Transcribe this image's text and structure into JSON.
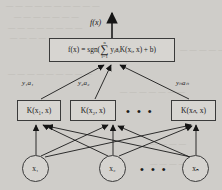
{
  "figure": {
    "type": "svm-architecture-diagram",
    "output_label": "f(x)",
    "decision_function": {
      "lhs": "f(x)",
      "equals": "=",
      "operator": "sgn(",
      "sum_upper": "n",
      "sum_lower": "i=1",
      "sum_symbol": "∑",
      "term": "yᵢaᵢK(xᵢ, x)",
      "plus_bias": "+ b)",
      "full_text": "f(x) = sgn( ∑(i=1..n) yᵢaᵢK(xᵢ, x) + b )"
    },
    "weights": [
      {
        "label": "y₁a₁"
      },
      {
        "label": "y₂a₂"
      },
      {
        "label": "yₙaₙ"
      }
    ],
    "kernel_nodes": [
      {
        "label": "K(x₁, x)"
      },
      {
        "label": "K(x₂, x)"
      },
      {
        "label": "K(xₙ, x)"
      }
    ],
    "kernel_row_ellipsis": "• • •",
    "input_nodes": [
      {
        "label": "x₁"
      },
      {
        "label": "x₂"
      },
      {
        "label": "xₙ"
      }
    ],
    "input_row_ellipsis": "• • •",
    "colors": {
      "page_background": "#cfcdc9",
      "node_fill": "#d7d5d1",
      "stroke": "#3a3a3a",
      "text": "#1a1a1a",
      "ghost_text": "#b9b6b1"
    }
  },
  "background_text": {
    "lines": [
      "— — — — — — — — — —",
      "— — — — — — —",
      "— — — — — — — —",
      "— — — — — —",
      "— — — — — — — — —",
      "— — — — —",
      "— — — — — — —",
      "— — — —",
      "— — — — — —"
    ]
  }
}
